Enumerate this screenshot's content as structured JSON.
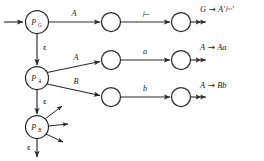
{
  "diagram": {
    "background_color": "#ffffff",
    "stroke_color": "#2b2b2b",
    "text_color": "#1a1a1a",
    "states": [
      {
        "id": "PG",
        "label": "P",
        "subscript": "G",
        "cx": 37,
        "cy": 22,
        "r": 11.5
      },
      {
        "id": "PA",
        "label": "P",
        "subscript": "A",
        "cx": 37,
        "cy": 78,
        "r": 11.5
      },
      {
        "id": "PB",
        "label": "P",
        "subscript": "B",
        "cx": 37,
        "cy": 127,
        "r": 11.5
      },
      {
        "id": "S1",
        "label": "",
        "subscript": "",
        "cx": 111,
        "cy": 22,
        "r": 9.5
      },
      {
        "id": "S2",
        "label": "",
        "subscript": "",
        "cx": 181,
        "cy": 22,
        "r": 9.5
      },
      {
        "id": "S3",
        "label": "",
        "subscript": "",
        "cx": 111,
        "cy": 60,
        "r": 9.5
      },
      {
        "id": "S4",
        "label": "",
        "subscript": "",
        "cx": 181,
        "cy": 60,
        "r": 9.5
      },
      {
        "id": "S5",
        "label": "",
        "subscript": "",
        "cx": 111,
        "cy": 97,
        "r": 9.5
      },
      {
        "id": "S6",
        "label": "",
        "subscript": "",
        "cx": 181,
        "cy": 97,
        "r": 9.5
      }
    ],
    "edge_labels": {
      "pg_to_s1": "A",
      "s1_to_s2": "⊢",
      "pa_to_s3": "A",
      "s3_to_s4": "a",
      "pa_to_s5": "B",
      "s5_to_s6": "b",
      "pg_to_pa": "ε",
      "pa_to_pb": "ε",
      "pb_down": "ε"
    },
    "rules": [
      {
        "id": "rule-top",
        "lhs": "G",
        "arrow": "→",
        "rhs": "A′⊢′",
        "x": 200,
        "y": 12
      },
      {
        "id": "rule-middle",
        "lhs": "A",
        "arrow": "→",
        "rhs": "Aa",
        "x": 200,
        "y": 50
      },
      {
        "id": "rule-bottom",
        "lhs": "A",
        "arrow": "→",
        "rhs": "Bb",
        "x": 200,
        "y": 88
      }
    ],
    "start_arrow": {
      "name": "start-arrow",
      "from_x": 4,
      "to_x": 24,
      "y": 22
    },
    "pb_fan_arrows": [
      {
        "id": "pb-fan-up",
        "angle_deg": -52
      },
      {
        "id": "pb-fan-middle",
        "angle_deg": -18
      },
      {
        "id": "pb-fan-down",
        "angle_deg": 20
      }
    ]
  }
}
